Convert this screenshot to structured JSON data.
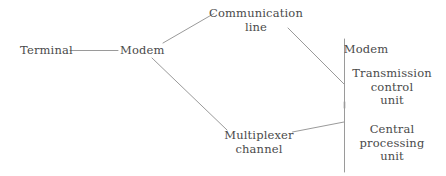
{
  "diagram": {
    "type": "block-connection-diagram",
    "background_color": "#ffffff",
    "line_color": "#9a9a9a",
    "text_color": "#4a4a4a",
    "nodes": [
      {
        "id": "terminal",
        "label": "Terminal",
        "label_line2": ""
      },
      {
        "id": "modem_left",
        "label": "Modem",
        "label_line2": ""
      },
      {
        "id": "comm_line",
        "label": "Communication",
        "label_line2": "line"
      },
      {
        "id": "multiplexer",
        "label": "Multiplexer",
        "label_line2": "channel"
      },
      {
        "id": "modem_right",
        "label": "Modem",
        "label_line2": ""
      },
      {
        "id": "tcu",
        "label": "Transmission",
        "label_line2": "control",
        "label_line3": "unit"
      },
      {
        "id": "cpu",
        "label": "Central",
        "label_line2": "processing",
        "label_line3": "unit"
      }
    ],
    "connectors": [
      {
        "id": "terminal-to-modem",
        "from": "terminal",
        "to": "modem_left",
        "style": "horizontal"
      },
      {
        "id": "modem-to-communication",
        "from": "modem_left",
        "to": "comm_line",
        "style": "diagonal-up"
      },
      {
        "id": "modem-to-multiplexer",
        "from": "modem_left",
        "to": "multiplexer",
        "style": "diagonal-down"
      },
      {
        "id": "communication-to-bracket",
        "from": "comm_line",
        "to": "bracket",
        "style": "diagonal-down"
      },
      {
        "id": "multiplexer-to-bracket",
        "from": "multiplexer",
        "to": "bracket",
        "style": "diagonal-up"
      }
    ],
    "bracket": {
      "id": "host-bracket",
      "orientation": "vertical",
      "groups": [
        "modem_right",
        "tcu",
        "cpu"
      ]
    }
  }
}
